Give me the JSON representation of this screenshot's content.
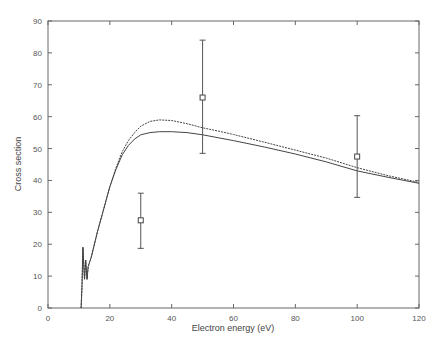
{
  "chart_data": {
    "type": "line",
    "title": "",
    "xlabel": "Electron energy (eV)",
    "ylabel": "Cross section",
    "xlim": [
      0,
      120
    ],
    "ylim": [
      0,
      90
    ],
    "xticks": [
      0,
      20,
      40,
      60,
      80,
      100,
      120
    ],
    "yticks": [
      0,
      10,
      20,
      30,
      40,
      50,
      60,
      70,
      80,
      90
    ],
    "grid": false,
    "legend": null,
    "series": [
      {
        "name": "curve-upper",
        "style": "dashed",
        "x": [
          10.7,
          11.0,
          11.3,
          11.8,
          12.2,
          12.6,
          13.0,
          14,
          16,
          18,
          20,
          22,
          24,
          26,
          28,
          30,
          33,
          36,
          40,
          45,
          50,
          55,
          60,
          70,
          80,
          90,
          100,
          110,
          120
        ],
        "y": [
          0,
          7,
          19,
          9,
          15,
          9,
          13,
          16,
          24,
          31,
          38,
          44,
          49,
          52.5,
          55,
          57,
          58.5,
          59,
          58.8,
          57.8,
          56.5,
          55.5,
          54.4,
          52,
          49.5,
          47,
          44,
          41.5,
          39.4
        ]
      },
      {
        "name": "curve-lower",
        "style": "solid",
        "x": [
          10.7,
          11.0,
          11.3,
          11.8,
          12.2,
          12.6,
          13.0,
          14,
          16,
          18,
          20,
          22,
          24,
          26,
          28,
          30,
          33,
          36,
          40,
          45,
          50,
          55,
          60,
          70,
          80,
          90,
          100,
          110,
          120
        ],
        "y": [
          0,
          7,
          19,
          9,
          15,
          9,
          13,
          16,
          24,
          31,
          38,
          43.5,
          48,
          51,
          53,
          54.3,
          55,
          55.3,
          55.3,
          55,
          54.3,
          53.4,
          52.5,
          50.5,
          48.3,
          45.8,
          43,
          41,
          39.1
        ]
      }
    ],
    "error_points": [
      {
        "x": 30,
        "y": 27.5,
        "ymin": 18.7,
        "ymax": 36
      },
      {
        "x": 50,
        "y": 66,
        "ymin": 48.5,
        "ymax": 84
      },
      {
        "x": 100,
        "y": 47.5,
        "ymin": 34.7,
        "ymax": 60.3
      }
    ]
  }
}
